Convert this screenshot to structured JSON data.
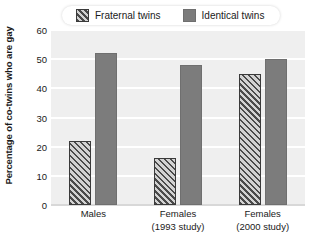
{
  "chart_data": {
    "type": "bar",
    "title": "",
    "xlabel": "",
    "ylabel": "Percentage of co-twins who are gay",
    "ylim": [
      0,
      60
    ],
    "yticks": [
      0,
      10,
      20,
      30,
      40,
      50,
      60
    ],
    "grid": true,
    "legend_position": "top",
    "categories": [
      {
        "line1": "Males",
        "line2": ""
      },
      {
        "line1": "Females",
        "line2": "(1993 study)"
      },
      {
        "line1": "Females",
        "line2": "(2000 study)"
      }
    ],
    "series": [
      {
        "name": "Fraternal twins",
        "style": "hatched",
        "color": "#b8b8b8",
        "values": [
          22,
          16,
          45
        ]
      },
      {
        "name": "Identical twins",
        "style": "solid",
        "color": "#7c7c7c",
        "values": [
          52,
          48,
          50
        ]
      }
    ]
  },
  "legend": {
    "items": [
      {
        "label": "Fraternal twins",
        "swatch": "hatched-swatch-icon"
      },
      {
        "label": "Identical twins",
        "swatch": "solid-swatch-icon"
      }
    ]
  },
  "axes": {
    "y_title": "Percentage of co-twins who are gay",
    "y_ticks": [
      "0",
      "10",
      "20",
      "30",
      "40",
      "50",
      "60"
    ],
    "x_labels": [
      {
        "line1": "Males",
        "line2": ""
      },
      {
        "line1": "Females",
        "line2": "(1993 study)"
      },
      {
        "line1": "Females",
        "line2": "(2000 study)"
      }
    ]
  },
  "colors": {
    "plot_background": "#efefef",
    "gridline": "#ffffff",
    "fraternal_fill": "#b8b8b8",
    "fraternal_hatch": "#4a4a4a",
    "identical_fill": "#7c7c7c",
    "text": "#1a1a1a"
  }
}
